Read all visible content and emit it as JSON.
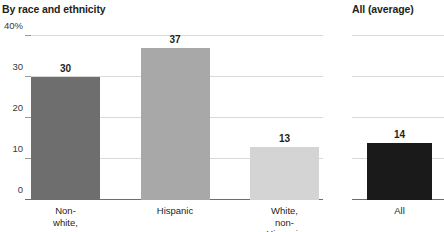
{
  "left_panel": {
    "title": "By race and ethnicity"
  },
  "right_panel": {
    "title": "All (average)"
  },
  "axis": {
    "ticks": [
      {
        "label": "40%",
        "value": 40
      },
      {
        "label": "30",
        "value": 30
      },
      {
        "label": "20",
        "value": 20
      },
      {
        "label": "10",
        "value": 10
      },
      {
        "label": "0",
        "value": 0
      }
    ]
  },
  "bars_left": [
    {
      "label": "Non-white,\nnon-Hispanic",
      "value": 30,
      "value_label": "30",
      "color": "#6e6e6e"
    },
    {
      "label": "Hispanic",
      "value": 37,
      "value_label": "37",
      "color": "#a8a8a8"
    },
    {
      "label": "White,\nnon-Hispanic",
      "value": 13,
      "value_label": "13",
      "color": "#d4d4d4"
    }
  ],
  "bars_right": [
    {
      "label": "All",
      "value": 14,
      "value_label": "14",
      "color": "#1a1a1a"
    }
  ],
  "chart_data": {
    "type": "bar",
    "title": "By race and ethnicity",
    "subtitle": "",
    "xlabel": "",
    "ylabel": "",
    "ylim": [
      0,
      40
    ],
    "yticks": [
      0,
      10,
      20,
      30,
      40
    ],
    "ytick_labels": [
      "0",
      "10",
      "20",
      "30",
      "40%"
    ],
    "grid": true,
    "legend": "none",
    "panels": [
      {
        "name": "By race and ethnicity",
        "categories": [
          "Non-white, non-Hispanic",
          "Hispanic",
          "White, non-Hispanic"
        ],
        "values": [
          30,
          37,
          13
        ],
        "colors": [
          "#6e6e6e",
          "#a8a8a8",
          "#d4d4d4"
        ],
        "data_labels": [
          "30",
          "37",
          "13"
        ]
      },
      {
        "name": "All (average)",
        "categories": [
          "All"
        ],
        "values": [
          14
        ],
        "colors": [
          "#1a1a1a"
        ],
        "data_labels": [
          "14"
        ]
      }
    ]
  }
}
